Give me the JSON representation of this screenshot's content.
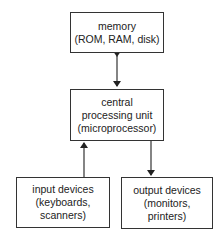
{
  "diagram": {
    "nodes": {
      "memory": {
        "lines": [
          "memory",
          "(ROM, RAM, disk)"
        ]
      },
      "cpu": {
        "lines": [
          "central",
          "processing unit",
          "(microprocessor)"
        ]
      },
      "input": {
        "lines": [
          "input devices",
          "(keyboards,",
          "scanners)"
        ]
      },
      "output": {
        "lines": [
          "output devices",
          "(monitors,",
          "printers)"
        ]
      }
    },
    "edges": [
      {
        "from": "memory",
        "to": "cpu",
        "direction": "bidirectional"
      },
      {
        "from": "input",
        "to": "cpu",
        "direction": "forward"
      },
      {
        "from": "cpu",
        "to": "output",
        "direction": "forward"
      }
    ],
    "colors": {
      "stroke": "#333333",
      "background": "#ffffff",
      "text": "#222222"
    }
  }
}
